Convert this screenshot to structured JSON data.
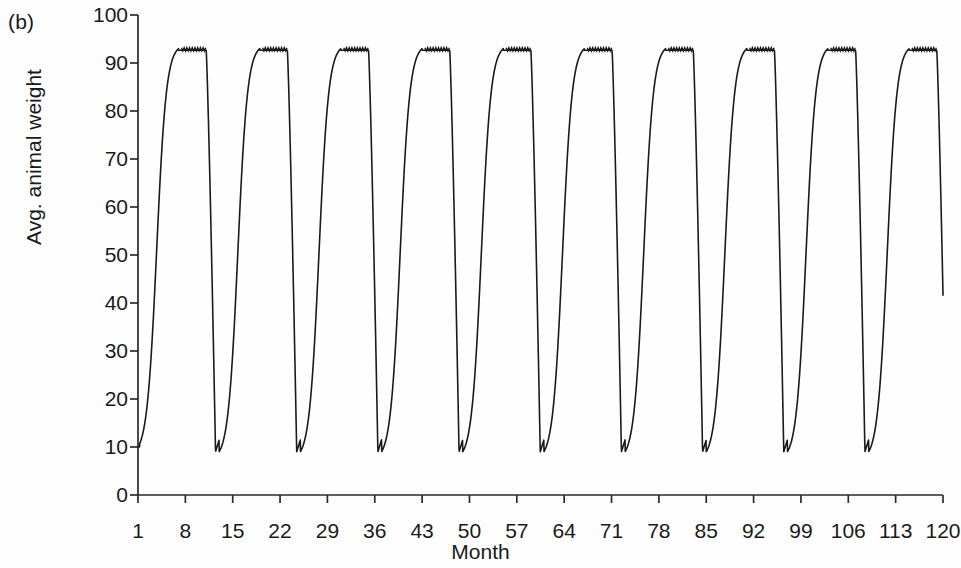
{
  "figure": {
    "panel_label": "(b)"
  },
  "chart_data": {
    "type": "line",
    "title": "",
    "subtitle": "",
    "xlabel": "Month",
    "ylabel": "Avg. animal weight",
    "xlim": [
      1,
      120
    ],
    "ylim": [
      0,
      100
    ],
    "grid": false,
    "legend": null,
    "annotations": [],
    "xticks": [
      1,
      8,
      15,
      22,
      29,
      36,
      43,
      50,
      57,
      64,
      71,
      78,
      85,
      92,
      99,
      106,
      113,
      120
    ],
    "xticklabels": [
      "1",
      "8",
      "15",
      "22",
      "29",
      "36",
      "43",
      "50",
      "57",
      "64",
      "71",
      "78",
      "85",
      "92",
      "99",
      "106",
      "113",
      "120"
    ],
    "yticks": [
      0,
      10,
      20,
      30,
      40,
      50,
      60,
      70,
      80,
      90,
      100
    ],
    "yticklabels": [
      "0",
      "10",
      "20",
      "30",
      "40",
      "50",
      "60",
      "70",
      "80",
      "90",
      "100"
    ],
    "series": [
      {
        "name": "Avg. animal weight",
        "color": "#1a1a1a",
        "cycle_period_months": 12,
        "cycle_count": 10,
        "peak_value": 93,
        "plateau_value": 92.6,
        "trough_value": 9,
        "start_value": 10,
        "description": "Sawtooth cycles: slow growth from ~10 to plateau ~93 over ~6 months, flat serrated plateau, then sharp V-shaped drop back to ~9.",
        "x": [
          1,
          2,
          3,
          4,
          5,
          6,
          7,
          8,
          9,
          10,
          11,
          12,
          13,
          14,
          15,
          16,
          17,
          18,
          19,
          20,
          21,
          22,
          23,
          24
        ],
        "y": [
          10.0,
          17.5,
          29.0,
          42.0,
          55.0,
          67.0,
          78.0,
          87.0,
          92.0,
          92.8,
          92.6,
          92.8,
          92.6,
          60.0,
          9.2,
          16.5,
          28.5,
          41.5,
          54.5,
          66.5,
          77.5,
          86.5,
          92.0,
          92.8
        ]
      }
    ]
  }
}
